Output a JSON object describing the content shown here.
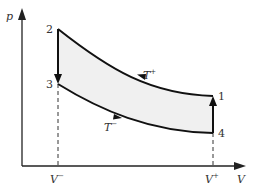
{
  "diagram": {
    "type": "thermodynamic-cycle-pV",
    "axes": {
      "y_label": "p",
      "x_label": "V"
    },
    "points": [
      {
        "id": "1",
        "label": "1"
      },
      {
        "id": "2",
        "label": "2"
      },
      {
        "id": "3",
        "label": "3"
      },
      {
        "id": "4",
        "label": "4"
      }
    ],
    "isotherms": {
      "hot": {
        "base": "T",
        "sup": "+"
      },
      "cold": {
        "base": "T",
        "sup": "−"
      }
    },
    "volume_ticks": {
      "min": {
        "base": "V",
        "sup": "−"
      },
      "max": {
        "base": "V",
        "sup": "+"
      }
    },
    "colors": {
      "stroke": "#111111",
      "fill": "#f0f0f0",
      "axis": "#222222"
    }
  }
}
